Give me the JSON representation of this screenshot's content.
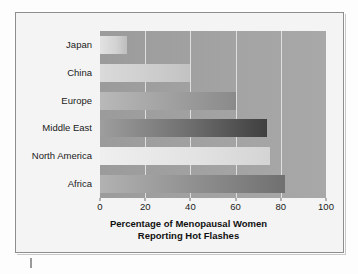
{
  "chart_data": {
    "type": "bar",
    "orientation": "horizontal",
    "title": "Percentage of Menopausal Women Reporting Hot Flashes",
    "title_line1": "Percentage of Menopausal Women",
    "title_line2": "Reporting Hot Flashes",
    "xlabel": "Percentage of Menopausal Women Reporting Hot Flashes",
    "ylabel": "",
    "categories": [
      "Japan",
      "China",
      "Europe",
      "Middle East",
      "North America",
      "Africa"
    ],
    "values": [
      12,
      40,
      60,
      74,
      75,
      82
    ],
    "xlim": [
      0,
      100
    ],
    "xticks": [
      0,
      20,
      40,
      60,
      80,
      100
    ],
    "xtick_labels": [
      "0",
      "20",
      "40",
      "60",
      "80",
      "100"
    ],
    "grid": true,
    "grid_axis": "x",
    "legend": null,
    "bar_colors": [
      "#d2d2d2",
      "#cfcfcf",
      "#9f9f9f",
      "#6d6d6d",
      "#e3e3e3",
      "#8d8d8d"
    ],
    "plot_background": "#a3a3a3",
    "gridline_color": "#e9e9e9",
    "frame_background": "#f4f4f4",
    "frame_border_color": "#8e8e8e",
    "text_color": "#1a1a1a"
  }
}
